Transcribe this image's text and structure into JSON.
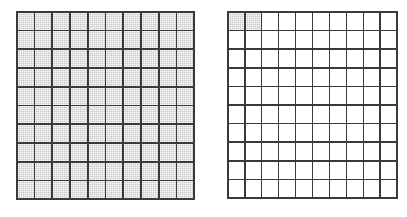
{
  "figure": {
    "background_color": "#ffffff",
    "width": 407,
    "height": 217,
    "grid_line_color": "#3a3a3a",
    "shade_color": "#c9c9c9",
    "unshaded_color": "#ffffff"
  },
  "chart_data": {
    "type": "heatmap",
    "title": "",
    "xlabel": "",
    "ylabel": "",
    "grids": [
      {
        "id": "grid-left",
        "label": "",
        "rows": 10,
        "columns": 10,
        "total_cells": 100,
        "shaded_count": 100,
        "fraction": "100/100",
        "values": [
          [
            1,
            1,
            1,
            1,
            1,
            1,
            1,
            1,
            1,
            1
          ],
          [
            1,
            1,
            1,
            1,
            1,
            1,
            1,
            1,
            1,
            1
          ],
          [
            1,
            1,
            1,
            1,
            1,
            1,
            1,
            1,
            1,
            1
          ],
          [
            1,
            1,
            1,
            1,
            1,
            1,
            1,
            1,
            1,
            1
          ],
          [
            1,
            1,
            1,
            1,
            1,
            1,
            1,
            1,
            1,
            1
          ],
          [
            1,
            1,
            1,
            1,
            1,
            1,
            1,
            1,
            1,
            1
          ],
          [
            1,
            1,
            1,
            1,
            1,
            1,
            1,
            1,
            1,
            1
          ],
          [
            1,
            1,
            1,
            1,
            1,
            1,
            1,
            1,
            1,
            1
          ],
          [
            1,
            1,
            1,
            1,
            1,
            1,
            1,
            1,
            1,
            1
          ],
          [
            1,
            1,
            1,
            1,
            1,
            1,
            1,
            1,
            1,
            1
          ]
        ]
      },
      {
        "id": "grid-right",
        "label": "",
        "rows": 10,
        "columns": 10,
        "total_cells": 100,
        "shaded_count": 2,
        "fraction": "2/100",
        "values": [
          [
            1,
            1,
            0,
            0,
            0,
            0,
            0,
            0,
            0,
            0
          ],
          [
            0,
            0,
            0,
            0,
            0,
            0,
            0,
            0,
            0,
            0
          ],
          [
            0,
            0,
            0,
            0,
            0,
            0,
            0,
            0,
            0,
            0
          ],
          [
            0,
            0,
            0,
            0,
            0,
            0,
            0,
            0,
            0,
            0
          ],
          [
            0,
            0,
            0,
            0,
            0,
            0,
            0,
            0,
            0,
            0
          ],
          [
            0,
            0,
            0,
            0,
            0,
            0,
            0,
            0,
            0,
            0
          ],
          [
            0,
            0,
            0,
            0,
            0,
            0,
            0,
            0,
            0,
            0
          ],
          [
            0,
            0,
            0,
            0,
            0,
            0,
            0,
            0,
            0,
            0
          ],
          [
            0,
            0,
            0,
            0,
            0,
            0,
            0,
            0,
            0,
            0
          ],
          [
            0,
            0,
            0,
            0,
            0,
            0,
            0,
            0,
            0,
            0
          ]
        ]
      }
    ]
  }
}
